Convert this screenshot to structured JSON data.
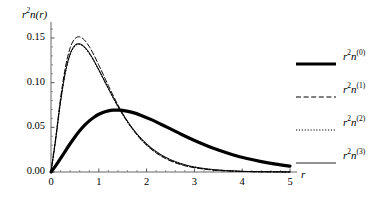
{
  "chart_data": {
    "type": "line",
    "title": "",
    "xlabel": "r",
    "ylabel": "r^2 n(r)",
    "xlim": [
      0,
      5.15
    ],
    "ylim": [
      0,
      0.168
    ],
    "grid": false,
    "legend_position": "right",
    "xticks": [
      "0",
      "1",
      "2",
      "3",
      "4",
      "5"
    ],
    "xtick_values": [
      0,
      1,
      2,
      3,
      4,
      5
    ],
    "yticks": [
      "0.00",
      "0.05",
      "0.10",
      "0.15"
    ],
    "ytick_values": [
      0.0,
      0.05,
      0.1,
      0.15
    ],
    "series": [
      {
        "name": "r^2 n(0)",
        "label_base": "r",
        "label_exp": "2",
        "label_fn": "n",
        "label_order": "(0)",
        "style": "thick-solid",
        "color": "#000000",
        "x": [
          0.0,
          0.1,
          0.2,
          0.3,
          0.4,
          0.5,
          0.6,
          0.7,
          0.8,
          0.9,
          1.0,
          1.1,
          1.2,
          1.3,
          1.4,
          1.5,
          1.7,
          1.9,
          2.1,
          2.3,
          2.5,
          2.7,
          2.9,
          3.1,
          3.3,
          3.5,
          3.8,
          4.1,
          4.4,
          4.7,
          5.0
        ],
        "y": [
          0.0,
          0.0072,
          0.0152,
          0.0235,
          0.0316,
          0.0392,
          0.0461,
          0.0521,
          0.0572,
          0.0613,
          0.0646,
          0.0669,
          0.0684,
          0.0692,
          0.0693,
          0.0689,
          0.0667,
          0.0631,
          0.0586,
          0.0535,
          0.0482,
          0.0429,
          0.0378,
          0.033,
          0.0286,
          0.0246,
          0.0194,
          0.0151,
          0.0116,
          0.0088,
          0.0066
        ]
      },
      {
        "name": "r^2 n(1)",
        "label_base": "r",
        "label_exp": "2",
        "label_fn": "n",
        "label_order": "(1)",
        "style": "dashed",
        "color": "#000000",
        "x": [
          0.0,
          0.1,
          0.2,
          0.3,
          0.4,
          0.5,
          0.6,
          0.7,
          0.8,
          0.9,
          1.0,
          1.1,
          1.2,
          1.4,
          1.6,
          1.8,
          2.0,
          2.2,
          2.4,
          2.6,
          2.8,
          3.0,
          3.3,
          3.6,
          4.0,
          4.4,
          4.7,
          5.0
        ],
        "y": [
          0.0,
          0.039,
          0.0825,
          0.1168,
          0.1389,
          0.1492,
          0.1513,
          0.1477,
          0.1404,
          0.1307,
          0.1197,
          0.1083,
          0.0968,
          0.0751,
          0.0566,
          0.0416,
          0.03,
          0.0213,
          0.0149,
          0.0103,
          0.007,
          0.0048,
          0.0026,
          0.0014,
          0.0006,
          0.0002,
          0.0001,
          0.0001
        ]
      },
      {
        "name": "r^2 n(2)",
        "label_base": "r",
        "label_exp": "2",
        "label_fn": "n",
        "label_order": "(2)",
        "style": "dotted",
        "color": "#000000",
        "x": [
          0.0,
          0.1,
          0.2,
          0.3,
          0.4,
          0.5,
          0.6,
          0.7,
          0.8,
          0.9,
          1.0,
          1.1,
          1.2,
          1.4,
          1.6,
          1.8,
          2.0,
          2.2,
          2.4,
          2.6,
          2.8,
          3.0,
          3.3,
          3.6,
          4.0,
          4.4,
          4.7,
          5.0
        ],
        "y": [
          0.0,
          0.0372,
          0.0786,
          0.111,
          0.1316,
          0.1412,
          0.143,
          0.1396,
          0.1329,
          0.1241,
          0.1141,
          0.1037,
          0.0932,
          0.0733,
          0.0561,
          0.0419,
          0.0308,
          0.0222,
          0.0158,
          0.0111,
          0.0077,
          0.0053,
          0.003,
          0.0017,
          0.0007,
          0.0003,
          0.0002,
          0.0001
        ]
      },
      {
        "name": "r^2 n(3)",
        "label_base": "r",
        "label_exp": "2",
        "label_fn": "n",
        "label_order": "(3)",
        "style": "thin-solid",
        "color": "#000000",
        "x": [
          0.0,
          0.1,
          0.2,
          0.3,
          0.4,
          0.5,
          0.6,
          0.7,
          0.8,
          0.9,
          1.0,
          1.1,
          1.2,
          1.4,
          1.6,
          1.8,
          2.0,
          2.2,
          2.4,
          2.6,
          2.8,
          3.0,
          3.3,
          3.6,
          4.0,
          4.4,
          4.7,
          5.0
        ],
        "y": [
          0.0,
          0.0374,
          0.079,
          0.1116,
          0.1322,
          0.1419,
          0.1436,
          0.1401,
          0.1334,
          0.1246,
          0.1146,
          0.1042,
          0.0937,
          0.0739,
          0.0568,
          0.0427,
          0.0316,
          0.023,
          0.0165,
          0.0117,
          0.0082,
          0.0057,
          0.0033,
          0.0019,
          0.0008,
          0.0004,
          0.0002,
          0.0001
        ]
      }
    ]
  },
  "axes": {
    "ylabel_base": "r",
    "ylabel_exp": "2",
    "ylabel_fn": "n",
    "ylabel_arg": "(r)",
    "xlabel_text": "r"
  },
  "legend": {
    "entries": [
      {
        "text_base": "r",
        "text_exp": "2",
        "text_fn": "n",
        "text_order": "(0)",
        "key": "thick-solid"
      },
      {
        "text_base": "r",
        "text_exp": "2",
        "text_fn": "n",
        "text_order": "(1)",
        "key": "dashed"
      },
      {
        "text_base": "r",
        "text_exp": "2",
        "text_fn": "n",
        "text_order": "(2)",
        "key": "dotted"
      },
      {
        "text_base": "r",
        "text_exp": "2",
        "text_fn": "n",
        "text_order": "(3)",
        "key": "thin-solid"
      }
    ]
  }
}
